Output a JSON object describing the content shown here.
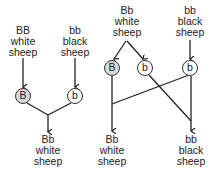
{
  "left_panel": {
    "parent1": {
      "genotype": "BB",
      "color": "white",
      "noun": "sheep"
    },
    "parent2": {
      "genotype": "bb",
      "color": "black",
      "noun": "sheep"
    },
    "gamete1": "B",
    "gamete2": "b",
    "offspring": {
      "genotype": "Bb",
      "color": "white",
      "noun": "sheep"
    }
  },
  "right_panel": {
    "parent1": {
      "genotype": "Bb",
      "color": "white",
      "noun": "sheep"
    },
    "parent2": {
      "genotype": "bb",
      "color": "black",
      "noun": "sheep"
    },
    "gametes": [
      "B",
      "b",
      "b"
    ],
    "offspring1": {
      "genotype": "Bb",
      "color": "white",
      "noun": "sheep"
    },
    "offspring2": {
      "genotype": "bb",
      "color": "black",
      "noun": "sheep"
    }
  },
  "colors": {
    "dominant_fill": "#d9d9d9",
    "recessive_fill": "#ffffff",
    "line": "#222222"
  }
}
